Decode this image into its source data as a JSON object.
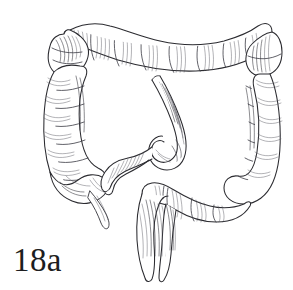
{
  "figure": {
    "label": "18a",
    "style": "engraving / cross-hatched pen-and-ink illustration",
    "background_color": "#ffffff",
    "ink_color": "#2b2b30",
    "label_color": "#1d1d20",
    "canvas": {
      "width": 293,
      "height": 290
    }
  },
  "parts": [
    {
      "id": "cecum",
      "name": "Cecum"
    },
    {
      "id": "appendix",
      "name": "Vermiform appendix"
    },
    {
      "id": "ascending-colon",
      "name": "Ascending colon"
    },
    {
      "id": "hepatic-flexure",
      "name": "Hepatic (right colic) flexure"
    },
    {
      "id": "transverse-colon",
      "name": "Transverse colon"
    },
    {
      "id": "splenic-flexure",
      "name": "Splenic (left colic) flexure"
    },
    {
      "id": "descending-colon",
      "name": "Descending colon"
    },
    {
      "id": "sigmoid-colon",
      "name": "Sigmoid colon"
    },
    {
      "id": "rectum",
      "name": "Rectum"
    },
    {
      "id": "ileum",
      "name": "Terminal ileum"
    }
  ]
}
